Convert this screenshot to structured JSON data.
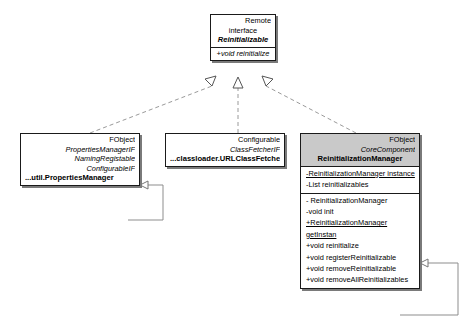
{
  "diagram": {
    "kind": "uml-class-diagram",
    "background_color": "#ffffff",
    "line_color": "#1a1a1a",
    "dashed_color": "#9a9a9a",
    "header_fill": "#c9c9c9"
  },
  "classes": {
    "reinitializable": {
      "stereotype_top": "Remote",
      "stereotype_kind": "interface",
      "name": "Reinitializable",
      "operations": [
        "+void reinitialize"
      ]
    },
    "properties_manager": {
      "stereotype_top": "FObject",
      "interfaces": [
        "PropertiesManagerIF",
        "NamingRegistable",
        "ConfigurableIF"
      ],
      "name": "...util.PropertiesManager"
    },
    "url_class_fetcher": {
      "stereotype_top": "Configurable",
      "interfaces": [
        "ClassFetcherIF"
      ],
      "name": "...classloader.URLClassFetcher"
    },
    "reinitialization_manager": {
      "stereotype_top": "FObject",
      "stereotype_second": "CoreComponent",
      "name": "ReinitializationManager",
      "attributes": [
        {
          "text": "-ReinitializationManager instance",
          "static": true
        },
        {
          "text": "-List reinitializables",
          "static": false
        }
      ],
      "operations": [
        {
          "text": "- ReinitializationManager",
          "static": false
        },
        {
          "text": "-void init",
          "static": false
        },
        {
          "text": "+ReinitializationManager getInstan",
          "static": true
        },
        {
          "text": "+void reinitialize",
          "static": false
        },
        {
          "text": "+void registerReinitializable",
          "static": false
        },
        {
          "text": "+void removeReinitializable",
          "static": false
        },
        {
          "text": "+void removeAllReinitializables",
          "static": false
        }
      ]
    }
  },
  "relationships": [
    {
      "name": "realization-properties-manager",
      "type": "realization",
      "from": "properties_manager",
      "to": "reinitializable"
    },
    {
      "name": "realization-url-class-fetcher",
      "type": "realization",
      "from": "url_class_fetcher",
      "to": "reinitializable"
    },
    {
      "name": "realization-reinitialization-manager",
      "type": "realization",
      "from": "reinitialization_manager",
      "to": "reinitializable"
    },
    {
      "name": "self-association-properties-manager",
      "type": "association",
      "from": "properties_manager",
      "to": "properties_manager"
    },
    {
      "name": "self-association-reinitialization-manager",
      "type": "association",
      "from": "reinitialization_manager",
      "to": "reinitialization_manager"
    }
  ]
}
